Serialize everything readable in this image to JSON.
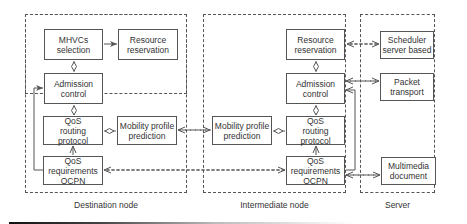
{
  "regions": {
    "destination": {
      "label": "Destination node"
    },
    "intermediate": {
      "label": "Intermediate node"
    },
    "server": {
      "label": "Server"
    }
  },
  "destination": {
    "mhvcs": {
      "line1": "MHVCs",
      "line2": "selection"
    },
    "resource": {
      "line1": "Resource",
      "line2": "reservation"
    },
    "admission": {
      "line1": "Admission",
      "line2": "control"
    },
    "qos_routing": {
      "line1": "QoS",
      "line2": "routing protocol"
    },
    "mobility": {
      "line1": "Mobility profile",
      "line2": "prediction"
    },
    "qos_req": {
      "line1": "QoS",
      "line2": "requirements",
      "line3": "OCPN"
    }
  },
  "intermediate": {
    "resource": {
      "line1": "Resource",
      "line2": "reservation"
    },
    "admission": {
      "line1": "Admission",
      "line2": "control"
    },
    "mobility": {
      "line1": "Mobility profile",
      "line2": "prediction"
    },
    "qos_routing": {
      "line1": "QoS",
      "line2": "routing protocol"
    },
    "qos_req": {
      "line1": "QoS",
      "line2": "requirements",
      "line3": "OCPN"
    }
  },
  "server": {
    "scheduler": {
      "line1": "Scheduler",
      "line2": "server based"
    },
    "packet": {
      "line1": "Packet",
      "line2": "transport"
    },
    "multimedia": {
      "line1": "Multimedia",
      "line2": "document"
    }
  },
  "colors": {
    "line": "#555555",
    "text": "#333333",
    "background": "#ffffff"
  }
}
